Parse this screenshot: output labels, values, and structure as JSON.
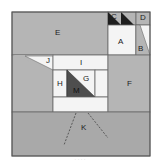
{
  "diagram": {
    "type": "dissection-puzzle",
    "colors": {
      "light_gray": "#b5b5b5",
      "white": "#f4f4f4",
      "dark": "#4e4e4e",
      "black": "#1e1e1e",
      "border": "#6a6a6a",
      "bottom": "#a9a9a9"
    },
    "pieces": [
      {
        "label": "A"
      },
      {
        "label": "B"
      },
      {
        "label": "C"
      },
      {
        "label": "D"
      },
      {
        "label": "E"
      },
      {
        "label": "F"
      },
      {
        "label": "G"
      },
      {
        "label": "H"
      },
      {
        "label": "I"
      },
      {
        "label": "J"
      },
      {
        "label": "K"
      },
      {
        "label": "M"
      }
    ],
    "caption": "· · · ·"
  }
}
